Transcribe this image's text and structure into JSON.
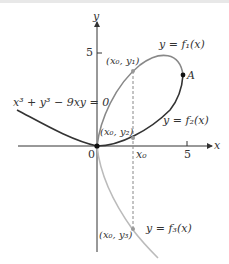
{
  "diagram": {
    "equation": {
      "lhs": "x³ + y³ − 9xy = 0"
    },
    "axes": {
      "x_label": "x",
      "y_label": "y",
      "origin_label": "0",
      "x_tick_label": "5",
      "y_tick_label": "5",
      "x0_label": "x₀"
    },
    "curves": [
      {
        "name": "f1",
        "label": "y = f₁(x)",
        "color": "#888888"
      },
      {
        "name": "f2",
        "label": "y = f₂(x)",
        "color": "#333333"
      },
      {
        "name": "f3",
        "label": "y = f₃(x)",
        "color": "#bbbbbb"
      }
    ],
    "points": [
      {
        "name": "A",
        "label": "A"
      },
      {
        "name": "x0y1",
        "label": "(x₀, y₁)"
      },
      {
        "name": "x0y2",
        "label": "(x₀, y₂)"
      },
      {
        "name": "x0y3",
        "label": "(x₀, y₃)"
      }
    ]
  }
}
